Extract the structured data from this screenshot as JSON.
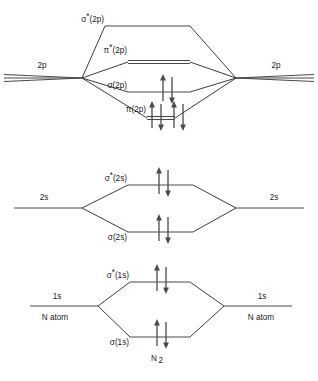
{
  "diagram": {
    "molecule_label": "N",
    "molecule_subscript": "2",
    "colors": {
      "line": "#4a4a4a",
      "text": "#1a1a1a",
      "background": "#ffffff"
    },
    "blocks": [
      {
        "id": "block-2p",
        "atomic_left_label": "2p",
        "atomic_right_label": "2p",
        "atomic_degeneracy": 3,
        "left_atom_label": "",
        "right_atom_label": "",
        "levels": [
          {
            "id": "sigma-star-2p",
            "label_sigma": "σ",
            "label_star": "*",
            "label_paren": "(2p)",
            "full_label": "σ*(2p)",
            "degeneracy": 1,
            "electron_pairs": 0
          },
          {
            "id": "pi-star-2p",
            "label_sigma": "π",
            "label_star": "*",
            "label_paren": "(2p)",
            "full_label": "π*(2p)",
            "degeneracy": 2,
            "electron_pairs": 0
          },
          {
            "id": "sigma-2p",
            "label_sigma": "σ",
            "label_star": "",
            "label_paren": "(2p)",
            "full_label": "σ(2p)",
            "degeneracy": 1,
            "electron_pairs": 1
          },
          {
            "id": "pi-2p",
            "label_sigma": "π",
            "label_star": "",
            "label_paren": "(2p)",
            "full_label": "π(2p)",
            "degeneracy": 2,
            "electron_pairs": 2
          }
        ]
      },
      {
        "id": "block-2s",
        "atomic_left_label": "2s",
        "atomic_right_label": "2s",
        "atomic_degeneracy": 1,
        "left_atom_label": "",
        "right_atom_label": "",
        "levels": [
          {
            "id": "sigma-star-2s",
            "label_sigma": "σ",
            "label_star": "*",
            "label_paren": "(2s)",
            "full_label": "σ*(2s)",
            "degeneracy": 1,
            "electron_pairs": 1
          },
          {
            "id": "sigma-2s",
            "label_sigma": "σ",
            "label_star": "",
            "label_paren": "(2s)",
            "full_label": "σ(2s)",
            "degeneracy": 1,
            "electron_pairs": 1
          }
        ]
      },
      {
        "id": "block-1s",
        "atomic_left_label": "1s",
        "atomic_right_label": "1s",
        "atomic_degeneracy": 1,
        "left_atom_label": "N atom",
        "right_atom_label": "N atom",
        "levels": [
          {
            "id": "sigma-star-1s",
            "label_sigma": "σ",
            "label_star": "*",
            "label_paren": "(1s)",
            "full_label": "σ*(1s)",
            "degeneracy": 1,
            "electron_pairs": 1
          },
          {
            "id": "sigma-1s",
            "label_sigma": "σ",
            "label_star": "",
            "label_paren": "(1s)",
            "full_label": "σ(1s)",
            "degeneracy": 1,
            "electron_pairs": 1
          }
        ]
      }
    ]
  }
}
